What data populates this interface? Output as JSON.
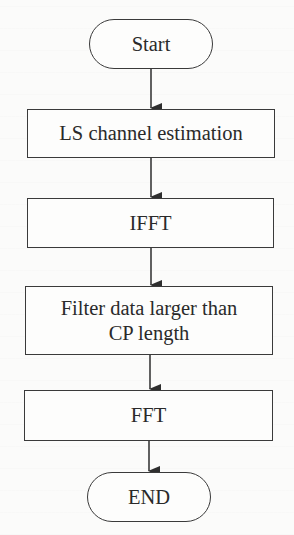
{
  "diagram": {
    "type": "flowchart",
    "direction": "top-to-bottom",
    "nodes": [
      {
        "id": "start",
        "shape": "terminal",
        "lines": [
          "Start"
        ]
      },
      {
        "id": "ls",
        "shape": "process",
        "lines": [
          "LS channel estimation"
        ]
      },
      {
        "id": "ifft",
        "shape": "process",
        "lines": [
          "IFFT"
        ]
      },
      {
        "id": "filter",
        "shape": "process",
        "lines": [
          "Filter data larger than",
          "CP length"
        ]
      },
      {
        "id": "fft",
        "shape": "process",
        "lines": [
          "FFT"
        ]
      },
      {
        "id": "end",
        "shape": "terminal",
        "lines": [
          "END"
        ]
      }
    ],
    "edges": [
      {
        "from": "start",
        "to": "ls"
      },
      {
        "from": "ls",
        "to": "ifft"
      },
      {
        "from": "ifft",
        "to": "filter"
      },
      {
        "from": "filter",
        "to": "fft"
      },
      {
        "from": "fft",
        "to": "end"
      }
    ],
    "colors": {
      "stroke": "#3a3a3a",
      "text": "#2a2a2a",
      "background": "#fbfbfa"
    }
  }
}
